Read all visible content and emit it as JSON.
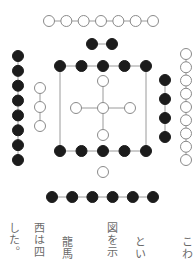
{
  "figure": {
    "colors": {
      "yang": "#ffffff",
      "yin": "#1c1c1c",
      "stroke": "#8a8a8a",
      "line": "#9a9a9a"
    },
    "groups": [
      {
        "name": "top-outer-white-7",
        "kind": "white",
        "orientation": "h",
        "count": 7,
        "x0": 49,
        "x1": 153,
        "y": 21
      },
      {
        "name": "top-inner-black-2",
        "kind": "black",
        "orientation": "h",
        "count": 2,
        "x0": 92,
        "x1": 112,
        "y": 44
      },
      {
        "name": "square-top-black-5",
        "kind": "black",
        "orientation": "h",
        "count": 5,
        "x0": 60,
        "x1": 146,
        "y": 66
      },
      {
        "name": "square-bottom-black-5",
        "kind": "black",
        "orientation": "h",
        "count": 5,
        "x0": 60,
        "x1": 146,
        "y": 151
      },
      {
        "name": "bottom-inner-white-1",
        "kind": "white",
        "orientation": "h",
        "count": 1,
        "x0": 103,
        "x1": 103,
        "y": 172
      },
      {
        "name": "bottom-outer-black-6",
        "kind": "black",
        "orientation": "h",
        "count": 6,
        "x0": 52,
        "x1": 153,
        "y": 197
      },
      {
        "name": "left-outer-black-8",
        "kind": "black",
        "orientation": "v",
        "count": 8,
        "x": 18,
        "y0": 56,
        "y1": 160
      },
      {
        "name": "left-inner-white-3",
        "kind": "white",
        "orientation": "v",
        "count": 3,
        "x": 40,
        "y0": 88,
        "y1": 126
      },
      {
        "name": "right-inner-black-4",
        "kind": "black",
        "orientation": "v",
        "count": 4,
        "x": 165,
        "y0": 80,
        "y1": 137
      },
      {
        "name": "right-outer-white-9",
        "kind": "white",
        "orientation": "v",
        "count": 9,
        "x": 186,
        "y0": 54,
        "y1": 160
      }
    ],
    "center_cross": {
      "count": 5,
      "cx": 103,
      "cy": 108,
      "arm": 27
    }
  },
  "text_columns": [
    {
      "text": "こわ",
      "x": 180
    },
    {
      "text": "とい",
      "x": 133
    },
    {
      "text": "図を示",
      "x": 105
    },
    {
      "text": "龍馬",
      "x": 60
    },
    {
      "text": "西は四",
      "x": 32
    },
    {
      "text": "した。",
      "x": 7
    }
  ]
}
